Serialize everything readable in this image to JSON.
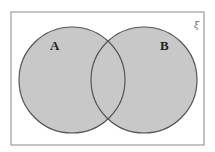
{
  "diagram": {
    "type": "venn",
    "universal_set": {
      "symbol": "ξ",
      "rect": {
        "x": 11,
        "y": 12,
        "width": 193,
        "height": 133
      },
      "stroke": "#8a8a8a"
    },
    "sets": [
      {
        "label": "A",
        "cx": 72,
        "cy": 80,
        "r": 53,
        "label_x": 50,
        "label_y": 50
      },
      {
        "label": "B",
        "cx": 144,
        "cy": 80,
        "r": 53,
        "label_x": 164,
        "label_y": 50
      }
    ],
    "fill": "#c8c8c8",
    "stroke": "#555555",
    "shaded_region": "A ∪ B"
  }
}
